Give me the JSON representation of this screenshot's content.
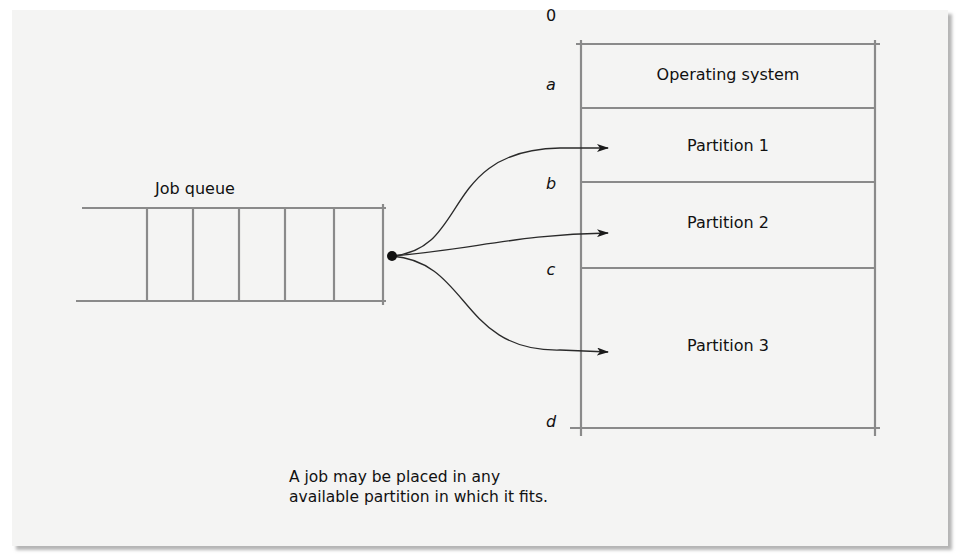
{
  "diagram": {
    "type": "fixed-partition-memory",
    "colors": {
      "background": "#f4f4f3",
      "line": "#8a8a8a",
      "text": "#111111",
      "arrow": "#222222"
    },
    "job_queue": {
      "label": "Job queue",
      "slot_count": 5
    },
    "memory": {
      "addresses": [
        {
          "label": "0",
          "italic": false
        },
        {
          "label": "a",
          "italic": true
        },
        {
          "label": "b",
          "italic": true
        },
        {
          "label": "c",
          "italic": true
        },
        {
          "label": "d",
          "italic": true
        }
      ],
      "regions": [
        {
          "label": "Operating system",
          "from": "0",
          "to": "a"
        },
        {
          "label": "Partition 1",
          "from": "a",
          "to": "b"
        },
        {
          "label": "Partition 2",
          "from": "b",
          "to": "c"
        },
        {
          "label": "Partition 3",
          "from": "c",
          "to": "d"
        }
      ]
    },
    "arrows": [
      {
        "from": "job-queue-head",
        "to": "Partition 1"
      },
      {
        "from": "job-queue-head",
        "to": "Partition 2"
      },
      {
        "from": "job-queue-head",
        "to": "Partition 3"
      }
    ],
    "caption": {
      "line1": "A job may be placed in any",
      "line2": "available partition in which it fits."
    }
  }
}
